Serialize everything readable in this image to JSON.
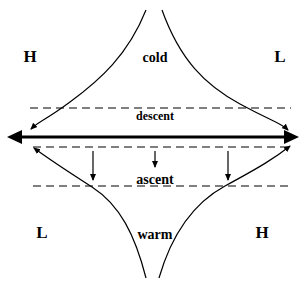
{
  "diagram": {
    "type": "atmospheric-flow-schematic",
    "colors": {
      "foreground": "#000000",
      "dashed": "#555555",
      "background": "#ffffff"
    },
    "labels": {
      "top_left_pressure": "H",
      "top_right_pressure": "L",
      "bottom_left_pressure": "L",
      "bottom_right_pressure": "H",
      "top_air_mass": "cold",
      "bottom_air_mass": "warm",
      "upper_layer": "descent",
      "lower_layer": "ascent"
    },
    "elements": {
      "main_axis": "double-headed thick horizontal arrow",
      "dashed_lines": 3,
      "vertical_down_arrows": 3,
      "curved_arrows": 4
    }
  }
}
